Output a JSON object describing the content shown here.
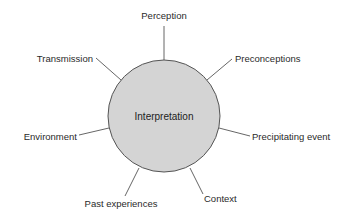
{
  "diagram": {
    "type": "radial-concept-map",
    "center": {
      "label": "Interpretation",
      "fill": "#d4d4d4",
      "stroke": "#555555"
    },
    "spokes": [
      {
        "id": "perception",
        "label": "Perception"
      },
      {
        "id": "preconceptions",
        "label": "Preconceptions"
      },
      {
        "id": "precipitating-event",
        "label": "Precipitating event"
      },
      {
        "id": "context",
        "label": "Context"
      },
      {
        "id": "past-experiences",
        "label": "Past experiences"
      },
      {
        "id": "environment",
        "label": "Environment"
      },
      {
        "id": "transmission",
        "label": "Transmission"
      }
    ],
    "line_color": "#555555",
    "text_color": "#2a2a2a"
  }
}
